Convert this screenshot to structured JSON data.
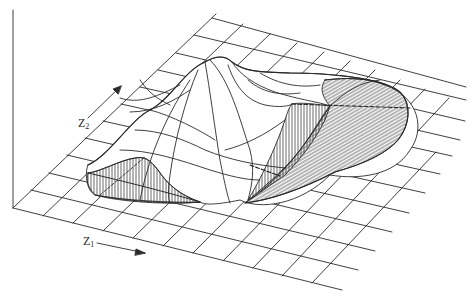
{
  "figure": {
    "type": "3d-surface-diagram",
    "colors": {
      "ink": "#2a2a2a",
      "background": "#ffffff"
    },
    "axes": {
      "z1": {
        "symbol": "Z",
        "subscript": "1",
        "arrow": "right-down"
      },
      "z2": {
        "symbol": "Z",
        "subscript": "2",
        "arrow": "up-right"
      },
      "vertical": {
        "label": ""
      }
    },
    "grid": {
      "rows": 11,
      "cols": 11
    },
    "surface": {
      "peaks": 1,
      "hatched_sections": 3,
      "dashed_reference_lines": 3
    }
  }
}
